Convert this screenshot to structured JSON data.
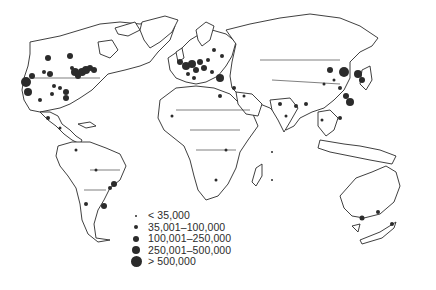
{
  "map": {
    "title": "",
    "projection": "world, Atlantic-centred",
    "colors": {
      "land_fill": "#ffffff",
      "outline": "#2a2a2a",
      "dot": "#2b2b2b"
    }
  },
  "legend": {
    "items": [
      {
        "label": "< 35,000",
        "size": 2
      },
      {
        "label": "35,001–100,000",
        "size": 4
      },
      {
        "label": "100,001–250,000",
        "size": 6
      },
      {
        "label": "250,001–500,000",
        "size": 8
      },
      {
        "label": "> 500,000",
        "size": 11
      }
    ]
  }
}
